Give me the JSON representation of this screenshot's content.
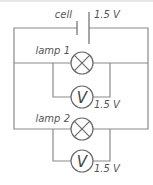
{
  "diagram": {
    "type": "circuit",
    "cell": {
      "label": "cell",
      "voltage": "1.5 V"
    },
    "lamps": [
      {
        "label": "lamp 1"
      },
      {
        "label": "lamp 2"
      }
    ],
    "voltmeters": [
      {
        "symbol": "V",
        "reading": "1.5 V"
      },
      {
        "symbol": "V",
        "reading": "1.5 V"
      }
    ],
    "colors": {
      "wire": "#8a8a8a",
      "component": "#6a6a6a",
      "text": "#555555"
    }
  }
}
